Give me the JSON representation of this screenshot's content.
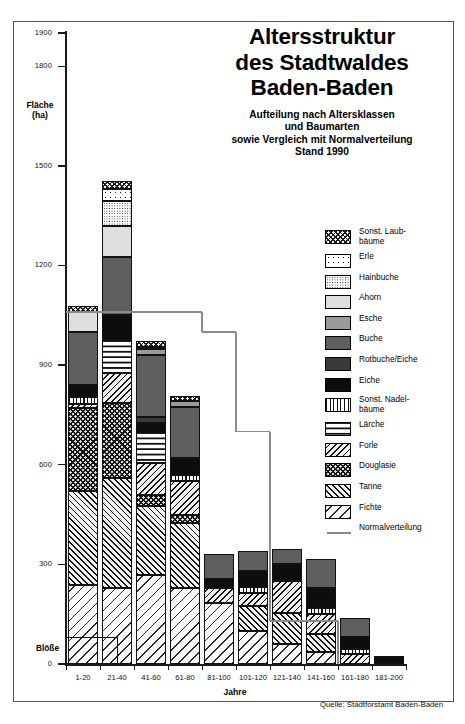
{
  "title": {
    "line1": "Altersstruktur",
    "line2": "des Stadtwaldes",
    "line3": "Baden-Baden",
    "sub1": "Aufteilung nach Altersklassen",
    "sub2": "und Baumarten",
    "sub3": "sowie Vergleich mit Normalverteilung",
    "sub4": "Stand 1990"
  },
  "source": "Quelle: Stadtforstamt Baden-Baden",
  "annotations": {
    "bloesse": "Blöße"
  },
  "axes": {
    "y_title_line1": "Fläche",
    "y_title_line2": "(ha)",
    "x_title": "Jahre"
  },
  "chart_data": {
    "type": "bar",
    "title": "Altersstruktur des Stadtwaldes Baden-Baden",
    "xlabel": "Jahre",
    "ylabel": "Fläche (ha)",
    "ylim": [
      0,
      1900
    ],
    "yticks": [
      0,
      300,
      600,
      900,
      1200,
      1500,
      1800,
      1900
    ],
    "grid": false,
    "stacked": true,
    "legend_position": "right",
    "categories": [
      "1-20",
      "21-40",
      "41-60",
      "61-80",
      "81-100",
      "101-120",
      "121-140",
      "141-160",
      "161-180",
      "181-200"
    ],
    "series": [
      {
        "name": "Fichte",
        "key": "fichte",
        "values": [
          237,
          230,
          267,
          230,
          185,
          100,
          60,
          35,
          0,
          0
        ]
      },
      {
        "name": "Tanne",
        "key": "tanne",
        "values": [
          285,
          330,
          208,
          195,
          0,
          75,
          95,
          55,
          0,
          0
        ]
      },
      {
        "name": "Douglasie",
        "key": "douglasie",
        "values": [
          250,
          225,
          35,
          25,
          0,
          0,
          0,
          0,
          0,
          0
        ]
      },
      {
        "name": "Forle",
        "key": "forle",
        "values": [
          12,
          90,
          95,
          100,
          45,
          40,
          95,
          60,
          30,
          0
        ]
      },
      {
        "name": "Lärche",
        "key": "laerche",
        "values": [
          0,
          100,
          95,
          0,
          0,
          0,
          0,
          0,
          0,
          0
        ]
      },
      {
        "name": "Sonst. Nadelbäume",
        "key": "sonstnadel",
        "values": [
          20,
          0,
          0,
          20,
          0,
          18,
          0,
          20,
          15,
          0
        ]
      },
      {
        "name": "Eiche",
        "key": "eiche",
        "values": [
          35,
          75,
          25,
          50,
          25,
          48,
          50,
          60,
          35,
          25
        ]
      },
      {
        "name": "Rotbuche/Eiche",
        "key": "rotbuche",
        "values": [
          0,
          0,
          20,
          0,
          0,
          0,
          0,
          0,
          0,
          0
        ]
      },
      {
        "name": "Buche",
        "key": "buche",
        "values": [
          160,
          175,
          185,
          155,
          75,
          60,
          45,
          85,
          60,
          0
        ]
      },
      {
        "name": "Esche",
        "key": "esche",
        "values": [
          0,
          0,
          18,
          18,
          0,
          0,
          0,
          0,
          0,
          0
        ]
      },
      {
        "name": "Ahorn",
        "key": "ahorn",
        "values": [
          60,
          95,
          8,
          0,
          0,
          0,
          0,
          0,
          0,
          0
        ]
      },
      {
        "name": "Hainbuche",
        "key": "hainbuche",
        "values": [
          0,
          75,
          0,
          0,
          0,
          0,
          0,
          0,
          0,
          0
        ]
      },
      {
        "name": "Erle",
        "key": "erle",
        "values": [
          0,
          35,
          0,
          0,
          0,
          0,
          0,
          0,
          0,
          0
        ]
      },
      {
        "name": "Sonst. Laubbäume",
        "key": "sonstlaub",
        "values": [
          20,
          25,
          18,
          15,
          0,
          0,
          0,
          0,
          0,
          0
        ]
      }
    ],
    "totals": [
      1079,
      1455,
      974,
      808,
      330,
      341,
      345,
      315,
      140,
      25
    ],
    "reference_line": {
      "name": "Normalverteilung",
      "type": "step",
      "values": [
        1060,
        1060,
        1060,
        1060,
        1000,
        700,
        130,
        130,
        0,
        0
      ]
    }
  },
  "legend": {
    "items": [
      {
        "label": "Sonst. Laub-\nbäume",
        "label1": "Sonst. Laub-",
        "label2": "bäume",
        "key": "sonstlaub",
        "two_line": true
      },
      {
        "label": "Erle",
        "key": "erle",
        "two_line": false
      },
      {
        "label": "Hainbuche",
        "key": "hainbuche",
        "two_line": false
      },
      {
        "label": "Ahorn",
        "key": "ahorn",
        "two_line": false
      },
      {
        "label": "Esche",
        "key": "esche",
        "two_line": false
      },
      {
        "label": "Buche",
        "key": "buche",
        "two_line": false
      },
      {
        "label": "Rotbuche/Eiche",
        "key": "rotbuche",
        "two_line": false
      },
      {
        "label": "Eiche",
        "key": "eiche",
        "two_line": false
      },
      {
        "label": "Sonst. Nadel-\nbäume",
        "label1": "Sonst. Nadel-",
        "label2": "bäume",
        "key": "sonstnadel",
        "two_line": true
      },
      {
        "label": "Lärche",
        "key": "laerche",
        "two_line": false
      },
      {
        "label": "Forle",
        "key": "forle",
        "two_line": false
      },
      {
        "label": "Douglasie",
        "key": "douglasie",
        "two_line": false
      },
      {
        "label": "Tanne",
        "key": "tanne",
        "two_line": false
      },
      {
        "label": "Fichte",
        "key": "fichte",
        "two_line": false
      }
    ],
    "line_item": {
      "label": "Normalverteilung",
      "color": "#8a8a8a"
    }
  },
  "colors": {
    "axis": "#1a1a1a",
    "frame": "#555555",
    "reference_line": "#8a8a8a"
  }
}
